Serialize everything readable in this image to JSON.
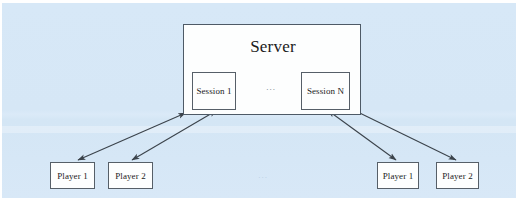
{
  "figure": {
    "kind": "architecture-diagram",
    "background_color": "#d7e8f7",
    "stroke_color": "#3b434b",
    "node_fill": "#fdfefe"
  },
  "server": {
    "title": "Server",
    "sessions": [
      {
        "id": "session-1",
        "label": "Session 1"
      },
      {
        "id": "session-n",
        "label": "Session N"
      }
    ],
    "sessions_ellipsis": "..."
  },
  "players": {
    "left_group": [
      {
        "id": "player-left-1",
        "label": "Player 1"
      },
      {
        "id": "player-left-2",
        "label": "Player 2"
      }
    ],
    "right_group": [
      {
        "id": "player-right-1",
        "label": "Player 1"
      },
      {
        "id": "player-right-2",
        "label": "Player 2"
      }
    ],
    "groups_ellipsis": "..."
  },
  "connections": {
    "style": "double-headed-arrow",
    "links": [
      {
        "from": "session-1",
        "to": "player-left-1"
      },
      {
        "from": "session-1",
        "to": "player-left-2"
      },
      {
        "from": "session-n",
        "to": "player-right-1"
      },
      {
        "from": "session-n",
        "to": "player-right-2"
      }
    ]
  }
}
